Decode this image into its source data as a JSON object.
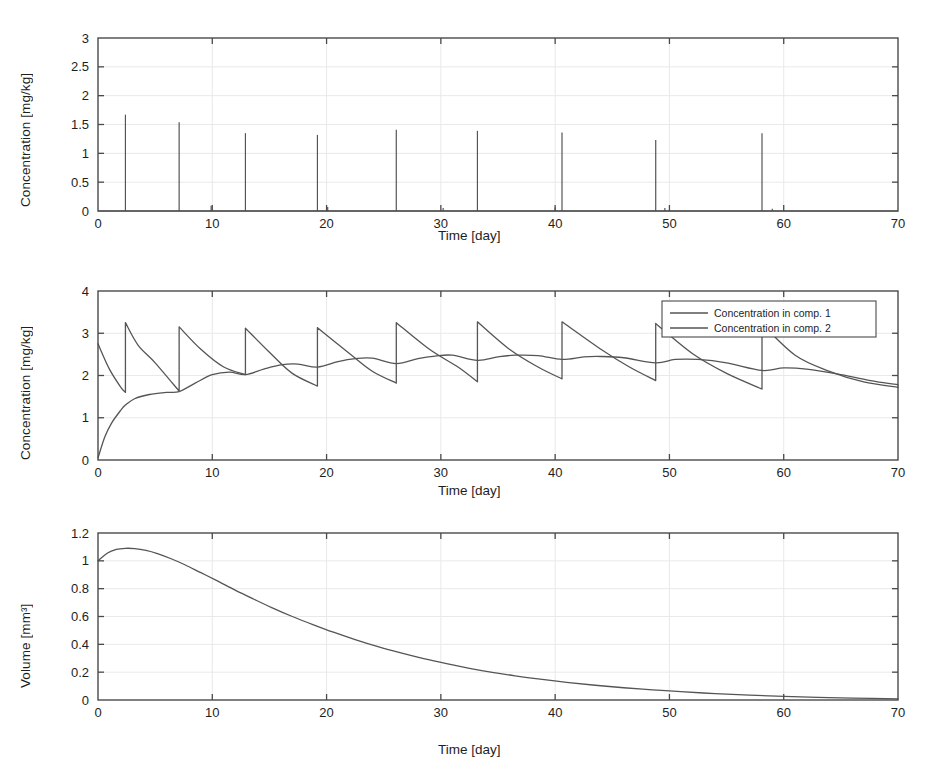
{
  "figure": {
    "background": "#ffffff",
    "line_color": "#555555",
    "axis_color": "#4a4a4a",
    "grid_color": "#e9e9e9"
  },
  "chart_data": [
    {
      "type": "line",
      "id": "panel-top",
      "title": "",
      "xlabel": "Time [day]",
      "ylabel": "Concentration [mg/kg]",
      "xlim": [
        0,
        70
      ],
      "ylim": [
        0,
        3
      ],
      "xticks": [
        0,
        10,
        20,
        30,
        40,
        50,
        60,
        70
      ],
      "xticklabels": [
        "0",
        "10",
        "20",
        "30",
        "40",
        "50",
        "60",
        "70"
      ],
      "yticks": [
        0,
        0.5,
        1,
        1.5,
        2,
        2.5,
        3
      ],
      "yticklabels": [
        "0",
        "0.5",
        "1",
        "1.5",
        "2",
        "2.5",
        "3"
      ],
      "grid": true,
      "legend": null,
      "series": [
        {
          "name": "Dosing impulses",
          "style": "impulse",
          "x": [
            2.4,
            7.1,
            9.9,
            12.9,
            19.2,
            20.1,
            26.1,
            30.2,
            33.2,
            40.0,
            40.6,
            48.8,
            49.6,
            58.1,
            59.0
          ],
          "values": [
            1.67,
            1.54,
            0.09,
            1.35,
            1.32,
            0.07,
            1.41,
            0.05,
            1.39,
            0.06,
            1.36,
            1.23,
            0.05,
            1.35,
            0.04
          ]
        }
      ]
    },
    {
      "type": "line",
      "id": "panel-middle",
      "title": "",
      "xlabel": "Time [day]",
      "ylabel": "Concentration [mg/kg]",
      "xlim": [
        0,
        70
      ],
      "ylim": [
        0,
        4
      ],
      "xticks": [
        0,
        10,
        20,
        30,
        40,
        50,
        60,
        70
      ],
      "xticklabels": [
        "0",
        "10",
        "20",
        "30",
        "40",
        "50",
        "60",
        "70"
      ],
      "yticks": [
        0,
        1,
        2,
        3,
        4
      ],
      "yticklabels": [
        "0",
        "1",
        "2",
        "3",
        "4"
      ],
      "grid": true,
      "legend": {
        "position": "upper right",
        "entries": [
          "Concentration in comp. 1",
          "Concentration in comp. 2"
        ]
      },
      "dose_times": [
        2.4,
        7.1,
        12.9,
        19.2,
        26.1,
        33.2,
        40.6,
        48.8,
        58.1
      ],
      "series": [
        {
          "name": "Concentration in comp. 1",
          "style": "sawtooth",
          "x": [
            0,
            1.0,
            2.0,
            2.4,
            2.4,
            3.5,
            5.0,
            7.1,
            7.1,
            9.0,
            11.0,
            12.9,
            12.9,
            15.0,
            17.0,
            19.2,
            19.2,
            22.0,
            24.0,
            26.1,
            26.1,
            29.0,
            31.5,
            33.2,
            33.2,
            36.0,
            38.5,
            40.6,
            40.6,
            44.0,
            46.5,
            48.8,
            48.8,
            52.0,
            55.0,
            58.1,
            58.1,
            61.0,
            64.0,
            67.0,
            70
          ],
          "values": [
            2.75,
            2.15,
            1.72,
            1.6,
            3.25,
            2.72,
            2.3,
            1.63,
            3.15,
            2.62,
            2.2,
            2.02,
            3.12,
            2.55,
            2.05,
            1.75,
            3.13,
            2.52,
            2.1,
            1.82,
            3.25,
            2.62,
            2.2,
            1.85,
            3.27,
            2.62,
            2.2,
            1.92,
            3.27,
            2.62,
            2.2,
            1.88,
            3.23,
            2.52,
            2.05,
            1.68,
            3.22,
            2.48,
            2.1,
            1.85,
            1.72
          ]
        },
        {
          "name": "Concentration in comp. 2",
          "style": "smooth",
          "x": [
            0,
            0.6,
            1.2,
            2.0,
            2.4,
            3.2,
            4.5,
            6.0,
            7.1,
            8.5,
            10.0,
            11.5,
            12.9,
            14.5,
            16.0,
            17.5,
            19.2,
            21.0,
            22.5,
            24.0,
            26.1,
            28.0,
            29.5,
            31.0,
            33.2,
            35.0,
            36.5,
            38.5,
            40.6,
            42.5,
            44.0,
            46.0,
            48.8,
            50.5,
            52.5,
            55.0,
            58.1,
            60.0,
            62.0,
            65.0,
            68.0,
            70
          ],
          "values": [
            0.05,
            0.55,
            0.88,
            1.18,
            1.3,
            1.45,
            1.55,
            1.6,
            1.62,
            1.82,
            2.02,
            2.08,
            2.02,
            2.15,
            2.25,
            2.27,
            2.2,
            2.33,
            2.4,
            2.41,
            2.28,
            2.4,
            2.46,
            2.48,
            2.36,
            2.44,
            2.48,
            2.47,
            2.38,
            2.44,
            2.45,
            2.42,
            2.3,
            2.38,
            2.38,
            2.3,
            2.12,
            2.18,
            2.15,
            2.02,
            1.86,
            1.78
          ]
        }
      ]
    },
    {
      "type": "line",
      "id": "panel-bottom",
      "title": "",
      "xlabel": "Time [day]",
      "ylabel": "Volume [mm³]",
      "xlim": [
        0,
        70
      ],
      "ylim": [
        0,
        1.2
      ],
      "xticks": [
        0,
        10,
        20,
        30,
        40,
        50,
        60,
        70
      ],
      "xticklabels": [
        "0",
        "10",
        "20",
        "30",
        "40",
        "50",
        "60",
        "70"
      ],
      "yticks": [
        0,
        0.2,
        0.4,
        0.6,
        0.8,
        1,
        1.2
      ],
      "yticklabels": [
        "0",
        "0.2",
        "0.4",
        "0.6",
        "0.8",
        "1",
        "1.2"
      ],
      "grid": true,
      "legend": null,
      "series": [
        {
          "name": "Tumour volume",
          "style": "smooth",
          "x": [
            0,
            0.8,
            1.6,
            2.4,
            3.2,
            4.2,
            5.2,
            6.4,
            7.6,
            9.0,
            10.4,
            12.0,
            13.6,
            15.2,
            17.0,
            18.8,
            20.6,
            22.5,
            24.5,
            26.5,
            28.5,
            30.5,
            32.5,
            34.5,
            36.5,
            38.5,
            41.0,
            43.5,
            46.0,
            48.5,
            51.0,
            54.0,
            57.0,
            60.0,
            63.0,
            66.0,
            70.0
          ],
          "values": [
            1.0,
            1.055,
            1.082,
            1.09,
            1.088,
            1.075,
            1.052,
            1.015,
            0.972,
            0.915,
            0.858,
            0.79,
            0.726,
            0.664,
            0.6,
            0.542,
            0.487,
            0.434,
            0.383,
            0.338,
            0.297,
            0.261,
            0.228,
            0.199,
            0.174,
            0.152,
            0.127,
            0.106,
            0.088,
            0.073,
            0.06,
            0.046,
            0.035,
            0.026,
            0.019,
            0.014,
            0.008
          ]
        }
      ]
    }
  ]
}
